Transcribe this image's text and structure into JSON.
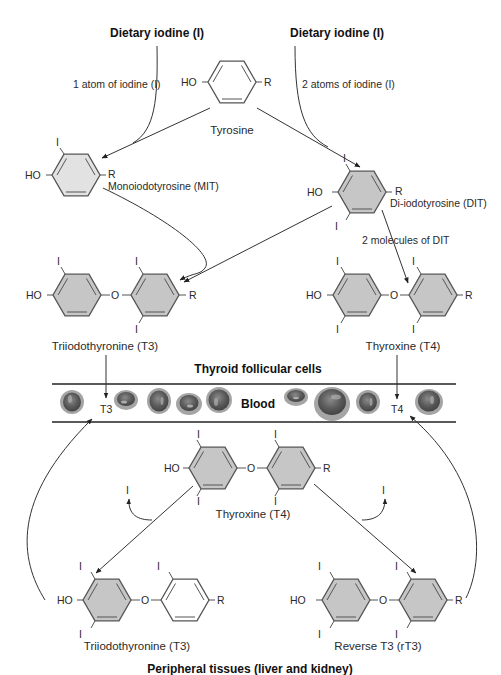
{
  "diagram": {
    "type": "biochemical-pathway",
    "sources": {
      "left": {
        "title": "Dietary iodine (I)",
        "note": "1 atom of iodine (I)"
      },
      "right": {
        "title": "Dietary iodine (I)",
        "note": "2 atoms of iodine (I)"
      }
    },
    "molecules": {
      "tyrosine": {
        "name": "Tyrosine",
        "left_group": "HO",
        "right_group": "R"
      },
      "mit": {
        "name": "Monoiodotyrosine (MIT)",
        "left_group": "HO",
        "right_group": "R",
        "iodine": "I"
      },
      "dit": {
        "name": "Di-iodotyrosine (DIT)",
        "left_group": "HO",
        "right_group": "R",
        "iodine": "I"
      },
      "t3_thyroid": {
        "name": "Triiodothyronine (T3)",
        "left_group": "HO",
        "bridge": "O",
        "right_group": "R",
        "iodine": "I"
      },
      "t4_thyroid": {
        "name": "Thyroxine (T4)",
        "left_group": "HO",
        "bridge": "O",
        "right_group": "R",
        "iodine": "I"
      },
      "t4_peripheral": {
        "name": "Thyroxine (T4)",
        "left_group": "HO",
        "bridge": "O",
        "right_group": "R",
        "iodine": "I"
      },
      "t3_peripheral": {
        "name": "Triiodothyronine (T3)",
        "left_group": "HO",
        "bridge": "O",
        "right_group": "R",
        "iodine": "I"
      },
      "rt3": {
        "name": "Reverse T3 (rT3)",
        "left_group": "HO",
        "bridge": "O",
        "right_group": "R",
        "iodine": "I"
      }
    },
    "annotations": {
      "dit_combine": "2 molecules of DIT",
      "released_iodine_left": "I",
      "released_iodine_right": "I"
    },
    "regions": {
      "thyroid": "Thyroid follicular cells",
      "blood": "Blood",
      "blood_t3": "T3",
      "blood_t4": "T4",
      "peripheral": "Peripheral tissues (liver and kidney)"
    },
    "colors": {
      "ring_fill": "#c8c8c8",
      "ring_fill_light": "#e4e4e4",
      "ring_stroke": "#555555",
      "line": "#333333",
      "rbc_outer": "#9a9a9a",
      "rbc_inner": "#5e5e5e"
    }
  }
}
